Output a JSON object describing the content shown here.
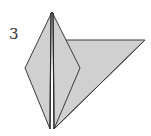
{
  "diagram": {
    "step_number": "3",
    "colors": {
      "paper_fill": "#d0d0d0",
      "outline": "#3a3a3a",
      "background": "#ffffff"
    },
    "shapes": {
      "flap_triangle": "66,40 145,40 54,129",
      "diamond_left": "52,12 25,68 50,129",
      "diamond_right": "52,12 80,68 54,129"
    },
    "creases": [
      {
        "x1": 51,
        "y1": 13,
        "x2": 50,
        "y2": 128
      },
      {
        "x1": 53,
        "y1": 13,
        "x2": 54,
        "y2": 128
      },
      {
        "x1": 54,
        "y1": 128,
        "x2": 80,
        "y2": 68
      }
    ]
  }
}
